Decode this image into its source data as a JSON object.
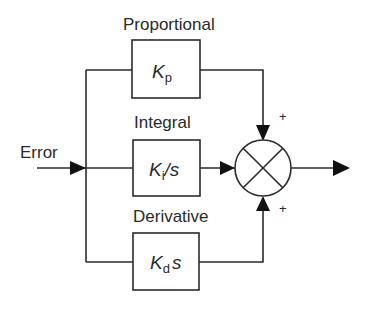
{
  "diagram": {
    "input": {
      "label": "Error"
    },
    "branches": [
      {
        "name": "Proportional",
        "label": "Proportional",
        "gain_symbol": "K",
        "gain_subscript": "p",
        "gain_suffix": "",
        "sign": "+"
      },
      {
        "name": "Integral",
        "label": "Integral",
        "gain_symbol": "K",
        "gain_subscript": "i",
        "gain_suffix": "/s",
        "sign": ""
      },
      {
        "name": "Derivative",
        "label": "Derivative",
        "gain_symbol": "K",
        "gain_subscript": "d",
        "gain_suffix": "s",
        "sign": "+"
      }
    ],
    "summing_junction": {
      "symbol": "cross-circle",
      "top_sign": "+",
      "bottom_sign": "+"
    },
    "output": {
      "label": ""
    },
    "colors": {
      "line": "#2b2b2b",
      "text": "#2a2a2a",
      "background": "#ffffff"
    }
  }
}
